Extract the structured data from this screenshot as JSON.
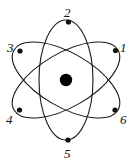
{
  "figure": {
    "name": "atom-model-diagram",
    "width": 135,
    "height": 165,
    "background_color": "#ffffff",
    "stroke_color": "#1a1a1a",
    "nucleus_color": "#000000",
    "electron_color": "#101010"
  },
  "nucleus": {
    "label": "nucleus",
    "cx": 66,
    "cy": 80,
    "r": 6.2
  },
  "orbits": [
    {
      "name": "orbit-vertical",
      "rotation_deg": 0,
      "rx": 27,
      "ry": 60
    },
    {
      "name": "orbit-tilted-right",
      "rotation_deg": 60,
      "rx": 27,
      "ry": 60
    },
    {
      "name": "orbit-tilted-left",
      "rotation_deg": -60,
      "rx": 27,
      "ry": 60
    }
  ],
  "electrons": [
    {
      "id": "electron-1",
      "label": "1",
      "cx": 115.5,
      "cy": 50.5,
      "r": 2.6,
      "label_x": 120,
      "label_y": 41
    },
    {
      "id": "electron-2",
      "label": "2",
      "cx": 68.5,
      "cy": 22.0,
      "r": 2.6,
      "label_x": 64,
      "label_y": 6
    },
    {
      "id": "electron-3",
      "label": "3",
      "cx": 20.0,
      "cy": 51.0,
      "r": 2.6,
      "label_x": 7,
      "label_y": 41
    },
    {
      "id": "electron-4",
      "label": "4",
      "cx": 19.5,
      "cy": 110.0,
      "r": 2.6,
      "label_x": 6,
      "label_y": 113
    },
    {
      "id": "electron-5",
      "label": "5",
      "cx": 68.0,
      "cy": 140.0,
      "r": 2.6,
      "label_x": 64,
      "label_y": 147
    },
    {
      "id": "electron-6",
      "label": "6",
      "cx": 115.0,
      "cy": 110.0,
      "r": 2.6,
      "label_x": 120,
      "label_y": 113
    }
  ]
}
